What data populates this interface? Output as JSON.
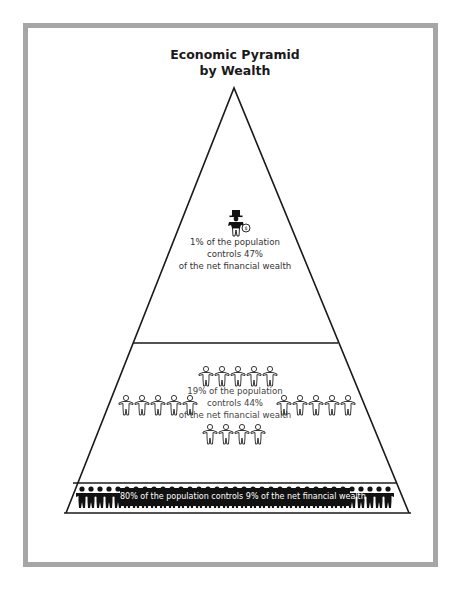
{
  "title": {
    "line1": "Economic Pyramid",
    "line2": "by Wealth"
  },
  "tiers": [
    {
      "id": "top",
      "population_pct": 1,
      "wealth_pct": 47,
      "lines": [
        "1% of the population",
        "controls 47%",
        "of the net financial wealth"
      ],
      "icon": "wealthy-man-with-money-bag-icon",
      "figure_count": 1
    },
    {
      "id": "middle",
      "population_pct": 19,
      "wealth_pct": 44,
      "lines": [
        "19% of the population",
        "controls 44%",
        "of the net financial wealth"
      ],
      "icon": "outline-person-chain-icon",
      "figure_rows": [
        5,
        10,
        4
      ]
    },
    {
      "id": "bottom",
      "population_pct": 80,
      "wealth_pct": 9,
      "text": "80% of the population controls 9% of the net financial wealth",
      "icon": "silhouette-crowd-icon"
    }
  ],
  "colors": {
    "frame": "#a6a6a6",
    "lines": "#1a1a1a",
    "crowd": "#111111",
    "background": "#ffffff"
  }
}
